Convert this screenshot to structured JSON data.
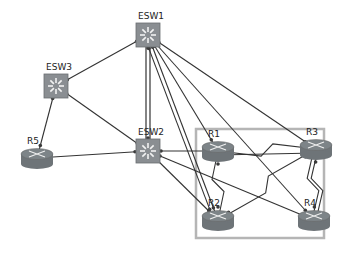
{
  "colors": {
    "switch": "#8a8e92",
    "router": "#7d8488",
    "link": "#333333",
    "area_box": "#b5b5b5",
    "endpoint": "#3a3a3a"
  },
  "area_box": {
    "x": 196,
    "y": 129,
    "w": 128,
    "h": 109
  },
  "devices": [
    {
      "id": "ESW1",
      "label": "ESW1",
      "type": "switch",
      "x": 148,
      "y": 35
    },
    {
      "id": "ESW3",
      "label": "ESW3",
      "type": "switch",
      "x": 56,
      "y": 86
    },
    {
      "id": "ESW2",
      "label": "ESW2",
      "type": "switch",
      "x": 148,
      "y": 151
    },
    {
      "id": "R5",
      "label": "R5",
      "type": "router",
      "x": 37,
      "y": 158
    },
    {
      "id": "R1",
      "label": "R1",
      "type": "router",
      "x": 218,
      "y": 151
    },
    {
      "id": "R3",
      "label": "R3",
      "type": "router",
      "x": 316,
      "y": 149
    },
    {
      "id": "R2",
      "label": "R2",
      "type": "router",
      "x": 218,
      "y": 220
    },
    {
      "id": "R4",
      "label": "R4",
      "type": "router",
      "x": 314,
      "y": 220
    }
  ],
  "links": [
    {
      "from": "ESW1",
      "to": "ESW3",
      "kind": "ethernet"
    },
    {
      "from": "ESW3",
      "to": "R5",
      "kind": "ethernet"
    },
    {
      "from": "ESW3",
      "to": "ESW2",
      "kind": "ethernet"
    },
    {
      "from": "R5",
      "to": "ESW2",
      "kind": "ethernet"
    },
    {
      "from": "ESW1",
      "to": "ESW2",
      "kind": "trunk-double"
    },
    {
      "from": "ESW1",
      "to": "R1",
      "kind": "ethernet"
    },
    {
      "from": "ESW1",
      "to": "R2",
      "kind": "ethernet"
    },
    {
      "from": "ESW1",
      "to": "R3",
      "kind": "ethernet"
    },
    {
      "from": "ESW1",
      "to": "R4",
      "kind": "ethernet"
    },
    {
      "from": "ESW1",
      "to": "R2",
      "kind": "ethernet"
    },
    {
      "from": "ESW2",
      "to": "R1",
      "kind": "ethernet"
    },
    {
      "from": "ESW2",
      "to": "R2",
      "kind": "ethernet"
    },
    {
      "from": "ESW2",
      "to": "R4",
      "kind": "ethernet"
    },
    {
      "from": "R1",
      "to": "R3",
      "kind": "serial"
    },
    {
      "from": "R1",
      "to": "R3",
      "kind": "ethernet"
    },
    {
      "from": "R1",
      "to": "R2",
      "kind": "serial"
    },
    {
      "from": "R2",
      "to": "R3",
      "kind": "serial"
    },
    {
      "from": "R3",
      "to": "R4",
      "kind": "serial-double"
    }
  ]
}
